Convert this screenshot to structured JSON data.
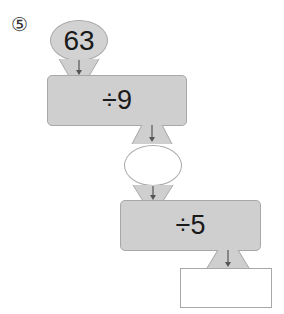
{
  "problem": {
    "number_label": "⑤",
    "start_value": "63",
    "step1": {
      "operation": "÷9"
    },
    "intermediate_value": "",
    "step2": {
      "operation": "÷5"
    },
    "answer_value": ""
  },
  "colors": {
    "shape_fill": "#cfcfcf",
    "shape_border": "#a8a8a8",
    "arrow": "#555555",
    "text": "#1a1a1a"
  }
}
